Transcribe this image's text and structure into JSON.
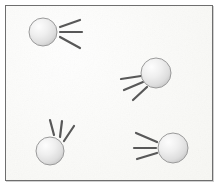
{
  "figure": {
    "title": "Four spheres with motion lines",
    "background_color": "#f6f6f2",
    "frame_color": "#6e6e6e",
    "frame": {
      "x": 5,
      "y": 5,
      "width": 208,
      "height": 176
    }
  },
  "style": {
    "sphere_fill_light": "#fcfcfc",
    "sphere_fill_mid": "#e9e9e9",
    "sphere_fill_dark": "#cfcfcf",
    "sphere_outline": "#9a9a9a",
    "line_color": "#585858",
    "line_width": 2.2
  },
  "objects": [
    {
      "name": "sphere-top-left",
      "label": "1",
      "cx": 43,
      "cy": 32,
      "r": 14,
      "direction": "right",
      "motion_lines": [
        {
          "x1": 60,
          "y1": 27,
          "x2": 80,
          "y2": 20
        },
        {
          "x1": 60,
          "y1": 32,
          "x2": 82,
          "y2": 32
        },
        {
          "x1": 60,
          "y1": 37,
          "x2": 80,
          "y2": 48
        }
      ]
    },
    {
      "name": "sphere-middle-right",
      "label": "2",
      "cx": 156,
      "cy": 73,
      "r": 15,
      "direction": "lower-left",
      "motion_lines": [
        {
          "x1": 141,
          "y1": 76,
          "x2": 121,
          "y2": 79
        },
        {
          "x1": 143,
          "y1": 82,
          "x2": 124,
          "y2": 90
        },
        {
          "x1": 147,
          "y1": 87,
          "x2": 133,
          "y2": 100
        }
      ]
    },
    {
      "name": "sphere-bottom-left",
      "label": "3",
      "cx": 50,
      "cy": 151,
      "r": 14,
      "direction": "upper-right",
      "motion_lines": [
        {
          "x1": 54,
          "y1": 135,
          "x2": 50,
          "y2": 120
        },
        {
          "x1": 60,
          "y1": 137,
          "x2": 62,
          "y2": 121
        },
        {
          "x1": 64,
          "y1": 141,
          "x2": 74,
          "y2": 126
        }
      ]
    },
    {
      "name": "sphere-bottom-right",
      "label": "4",
      "cx": 173,
      "cy": 148,
      "r": 15,
      "direction": "left",
      "motion_lines": [
        {
          "x1": 157,
          "y1": 142,
          "x2": 136,
          "y2": 133
        },
        {
          "x1": 156,
          "y1": 148,
          "x2": 134,
          "y2": 148
        },
        {
          "x1": 157,
          "y1": 153,
          "x2": 137,
          "y2": 159
        }
      ]
    }
  ]
}
